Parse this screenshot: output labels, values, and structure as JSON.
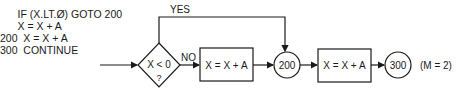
{
  "code": {
    "lines": [
      "      IF (X.LT.Ø) GOTO 200",
      "      X = X + A",
      "200  X = X + A",
      "300  CONTINUE"
    ]
  },
  "flowchart": {
    "yes_label": "YES",
    "no_label": "NO",
    "decision_label": "X < 0",
    "decision_question": "?",
    "box1_label": "X = X + A",
    "node_200": "200",
    "box2_label": "X = X + A",
    "node_300": "300",
    "annotation": "(M = 2)"
  }
}
